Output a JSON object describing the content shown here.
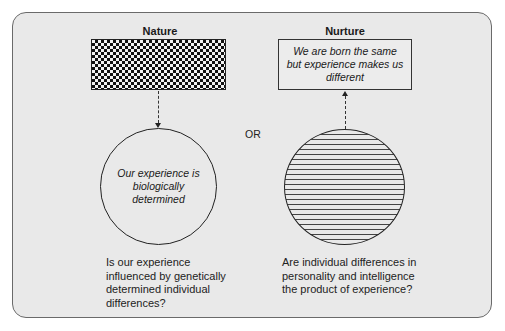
{
  "nature": {
    "heading": "Nature",
    "circle_text": "Our experience is biologically determined",
    "question": "Is our experience influenced by genetically determined individual differences?"
  },
  "connector": {
    "label": "OR"
  },
  "nurture": {
    "heading": "Nurture",
    "box_text": "We are born the same but experience makes us different",
    "question": "Are individual differences in personality and intelligence the product of experience?"
  }
}
